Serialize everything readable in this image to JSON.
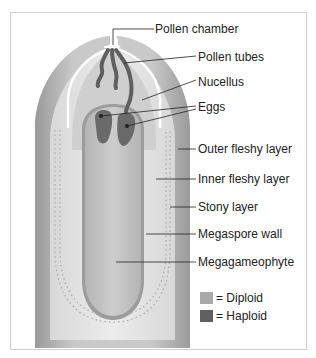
{
  "figure": {
    "labels": {
      "pollen_chamber": "Pollen chamber",
      "pollen_tubes": "Pollen tubes",
      "nucellus": "Nucellus",
      "eggs": "Eggs",
      "outer_fleshy_layer": "Outer fleshy layer",
      "inner_fleshy_layer": "Inner fleshy layer",
      "stony_layer": "Stony layer",
      "megaspore_wall": "Megaspore wall",
      "megagameophyte": "Megagameophyte"
    },
    "legend": [
      {
        "label": "= Diploid",
        "color": "#a9a9a9"
      },
      {
        "label": "= Haploid",
        "color": "#5f5f5f"
      }
    ]
  }
}
